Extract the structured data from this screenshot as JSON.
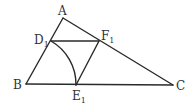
{
  "diagram": {
    "type": "geometry",
    "points": {
      "A": {
        "label": "A",
        "sub": "",
        "x": 63,
        "y": 18
      },
      "B": {
        "label": "B",
        "sub": "",
        "x": 26,
        "y": 84
      },
      "C": {
        "label": "C",
        "sub": "",
        "x": 173,
        "y": 85
      },
      "D1": {
        "label": "D",
        "sub": "1",
        "x": 51,
        "y": 41
      },
      "E1": {
        "label": "E",
        "sub": "1",
        "x": 76,
        "y": 85
      },
      "F1": {
        "label": "F",
        "sub": "1",
        "x": 99,
        "y": 41
      }
    },
    "segments": [
      [
        "A",
        "B"
      ],
      [
        "B",
        "C"
      ],
      [
        "C",
        "A"
      ],
      [
        "D1",
        "F1"
      ],
      [
        "F1",
        "E1"
      ]
    ],
    "arcs": [
      {
        "from": "D1",
        "to": "E1",
        "center": "B"
      }
    ],
    "stroke_color": "#2a2a2a",
    "label_color": "#333333"
  }
}
